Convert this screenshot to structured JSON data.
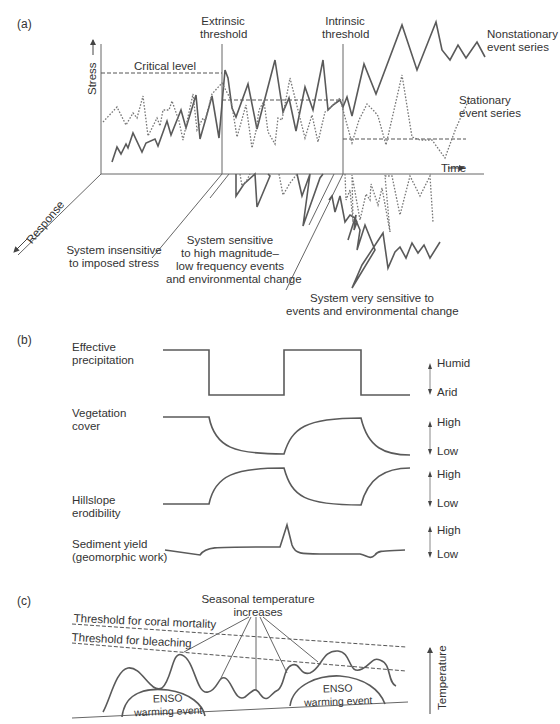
{
  "panel_a": {
    "letter": "(a)",
    "extrinsic_threshold": [
      "Extrinsic",
      "threshold"
    ],
    "intrinsic_threshold": [
      "Intrinsic",
      "threshold"
    ],
    "critical_level": "Critical level",
    "stress_axis": "Stress",
    "time_axis": "Time",
    "response_axis": "Response",
    "nonstationary": [
      "Nonstationary",
      "event series"
    ],
    "stationary": [
      "Stationary",
      "event series"
    ],
    "zone1": [
      "System insensitive",
      "to imposed stress"
    ],
    "zone2": [
      "System sensitive",
      "to high magnitude–",
      "low frequency events",
      "and environmental change"
    ],
    "zone3": [
      "System very sensitive to",
      "events and environmental change"
    ]
  },
  "panel_b": {
    "letter": "(b)",
    "rows": [
      {
        "label": [
          "Effective",
          "precipitation"
        ],
        "high": "Humid",
        "low": "Arid"
      },
      {
        "label": [
          "Vegetation",
          "cover"
        ],
        "high": "High",
        "low": "Low"
      },
      {
        "label": [
          "Hillslope",
          "erodibility"
        ],
        "high": "High",
        "low": "Low"
      },
      {
        "label": [
          "Sediment yield",
          "(geomorphic work)"
        ],
        "high": "High",
        "low": "Low"
      }
    ]
  },
  "panel_c": {
    "letter": "(c)",
    "mortality_threshold": "Threshold for coral mortality",
    "bleaching_threshold": "Threshold for bleaching",
    "seasonal": [
      "Seasonal temperature",
      "increases"
    ],
    "enso": [
      "ENSO",
      "warming event"
    ],
    "temperature_axis": "Temperature"
  }
}
